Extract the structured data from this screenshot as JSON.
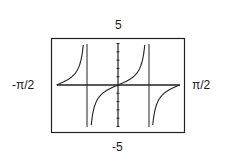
{
  "chart_data": {
    "type": "line",
    "title": "",
    "function": "y = tan(2x)",
    "xlabel": "",
    "ylabel": "",
    "xlim": [
      "-π/2",
      "π/2"
    ],
    "ylim": [
      -5,
      5
    ],
    "window_labels": {
      "ymax": "5",
      "ymin": "-5",
      "xmin": "-π/2",
      "xmax": "π/2"
    },
    "vertical_asymptotes": [
      "-π/4",
      "π/4"
    ],
    "y_ticks": [
      -5,
      -4,
      -3,
      -2,
      -1,
      0,
      1,
      2,
      3,
      4,
      5
    ],
    "grid": false,
    "legend": null,
    "series": [
      {
        "name": "tan(2x)",
        "x": [
          -1.5708,
          -1.3,
          -1.0,
          -0.9,
          -0.8,
          -0.7854,
          -0.77,
          -0.6,
          -0.3,
          0,
          0.3,
          0.6,
          0.77,
          0.7854,
          0.8,
          0.9,
          1.0,
          1.3,
          1.5708
        ],
        "y": [
          0,
          0.6,
          2.2,
          5,
          null,
          null,
          null,
          -2.6,
          -0.7,
          0,
          0.7,
          2.6,
          null,
          null,
          null,
          -5,
          -2.2,
          -0.6,
          0
        ]
      }
    ]
  }
}
